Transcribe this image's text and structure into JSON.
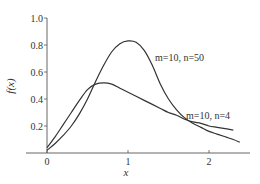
{
  "chart_data": {
    "type": "line",
    "title": "",
    "xlabel": "x",
    "ylabel": "f(x)",
    "xlim": [
      -0.25,
      2.5
    ],
    "ylim": [
      0,
      1.05
    ],
    "xticks": [
      0,
      1,
      2
    ],
    "xtick_labels": [
      "0",
      "1",
      "2"
    ],
    "yticks": [
      0.2,
      0.4,
      0.6,
      0.8,
      1.0
    ],
    "ytick_labels": [
      "0.2",
      "0.4",
      "0.6",
      "0.8",
      "1.0"
    ],
    "grid": false,
    "legend": "inline annotations",
    "series": [
      {
        "name": "m=10, n=50",
        "x": [
          0,
          0.1,
          0.2,
          0.3,
          0.4,
          0.5,
          0.6,
          0.7,
          0.8,
          0.9,
          1.0,
          1.1,
          1.2,
          1.3,
          1.4,
          1.5,
          1.6,
          1.7,
          1.8,
          1.9,
          2.0,
          2.1,
          2.2,
          2.3,
          2.38
        ],
        "y": [
          0.02,
          0.07,
          0.13,
          0.2,
          0.29,
          0.4,
          0.53,
          0.65,
          0.75,
          0.81,
          0.83,
          0.82,
          0.76,
          0.65,
          0.51,
          0.4,
          0.32,
          0.26,
          0.22,
          0.19,
          0.16,
          0.14,
          0.12,
          0.1,
          0.08
        ]
      },
      {
        "name": "m=10, n=4",
        "x": [
          0,
          0.1,
          0.2,
          0.3,
          0.4,
          0.5,
          0.6,
          0.7,
          0.8,
          0.9,
          1.0,
          1.1,
          1.2,
          1.3,
          1.4,
          1.5,
          1.6,
          1.7,
          1.8,
          1.9,
          2.0,
          2.1,
          2.2,
          2.3
        ],
        "y": [
          0.04,
          0.12,
          0.21,
          0.3,
          0.39,
          0.47,
          0.51,
          0.52,
          0.51,
          0.48,
          0.45,
          0.42,
          0.39,
          0.36,
          0.33,
          0.3,
          0.28,
          0.25,
          0.23,
          0.22,
          0.2,
          0.19,
          0.18,
          0.17
        ]
      }
    ],
    "annotations": [
      {
        "text": "m=10, n=50",
        "x": 1.35,
        "y": 0.8
      },
      {
        "text": "m=10, n=4",
        "x": 1.75,
        "y": 0.27
      }
    ]
  },
  "labels": {
    "xlabel": "x",
    "ylabel": "f(x)",
    "ann_n50": "m=10, n=50",
    "ann_n4": "m=10, n=4"
  },
  "colors": {
    "line": "#333333",
    "axis": "#555555"
  }
}
